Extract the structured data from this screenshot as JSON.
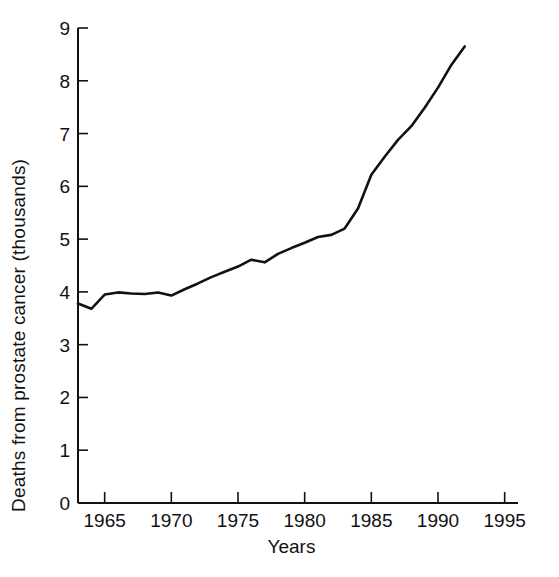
{
  "chart_data": {
    "type": "line",
    "title": "",
    "xlabel": "Years",
    "ylabel": "Deaths from prostate cancer (thousands)",
    "xlim": [
      1963,
      1996
    ],
    "ylim": [
      0,
      9
    ],
    "xticks": [
      1965,
      1970,
      1975,
      1980,
      1985,
      1990,
      1995
    ],
    "yticks": [
      0,
      1,
      2,
      3,
      4,
      5,
      6,
      7,
      8,
      9
    ],
    "xtick_labels": [
      "1965",
      "1970",
      "1975",
      "1980",
      "1985",
      "1990",
      "1995"
    ],
    "ytick_labels": [
      "0",
      "1",
      "2",
      "3",
      "4",
      "5",
      "6",
      "7",
      "8",
      "9"
    ],
    "grid": false,
    "legend": null,
    "line_color": "#111111",
    "line_width": 2.6,
    "x": [
      1963,
      1964,
      1965,
      1966,
      1967,
      1968,
      1969,
      1970,
      1971,
      1972,
      1973,
      1974,
      1975,
      1976,
      1977,
      1978,
      1979,
      1980,
      1981,
      1982,
      1983,
      1984,
      1985,
      1986,
      1987,
      1988,
      1989,
      1990,
      1991,
      1992
    ],
    "values": [
      3.78,
      3.68,
      3.95,
      3.99,
      3.97,
      3.96,
      3.99,
      3.93,
      4.05,
      4.16,
      4.28,
      4.38,
      4.48,
      4.61,
      4.56,
      4.72,
      4.83,
      4.93,
      5.04,
      5.08,
      5.2,
      5.58,
      6.22,
      6.56,
      6.88,
      7.14,
      7.49,
      7.87,
      8.3,
      8.65
    ],
    "series": [
      {
        "name": "Deaths from prostate cancer",
        "values": [
          3.78,
          3.68,
          3.95,
          3.99,
          3.97,
          3.96,
          3.99,
          3.93,
          4.05,
          4.16,
          4.28,
          4.38,
          4.48,
          4.61,
          4.56,
          4.72,
          4.83,
          4.93,
          5.04,
          5.08,
          5.2,
          5.58,
          6.22,
          6.56,
          6.88,
          7.14,
          7.49,
          7.87,
          8.3,
          8.65
        ]
      }
    ]
  },
  "axes": {
    "y_axis_title": "Deaths from prostate cancer (thousands)",
    "x_axis_title": "Years"
  }
}
